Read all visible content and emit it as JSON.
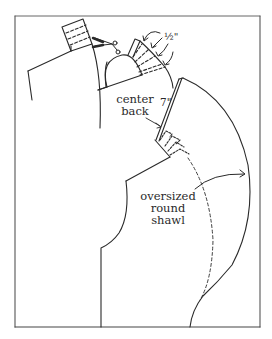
{
  "figure": {
    "type": "sewing pattern diagram",
    "colors": {
      "line": "#2a2a2a",
      "frame": "#555555",
      "background": "#ffffff"
    }
  },
  "labels": {
    "half_inch": "½\"",
    "center_back_line1": "center",
    "center_back_line2": "back",
    "seven_inch": "7\"",
    "shawl_line1": "oversized",
    "shawl_line2": "round",
    "shawl_line3": "shawl"
  },
  "icons": {
    "scissors": "scissors-icon"
  }
}
